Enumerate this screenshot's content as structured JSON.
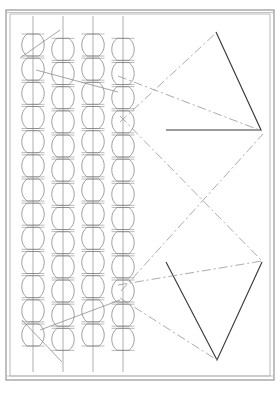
{
  "drawing": {
    "title": "Technical line drawing",
    "description": "Patent-style mechanical schematic: four vertical columns of stacked rounded cells on the left, two solid outline triangles on the right, connected by dash-dot construction lines.",
    "canvas": {
      "width": 280,
      "height": 395
    },
    "colors": {
      "background": "#ffffff",
      "frame_outer": "#8a8a8a",
      "frame_inner": "#b4b4b4",
      "cell_stroke": "#808080",
      "column_line": "#9a9a9a",
      "triangle_stroke": "#3a3a3a",
      "construction_line": "#9c9c9c",
      "diagonal_line": "#8e8e8e"
    },
    "frame": {
      "outer": {
        "x": 6,
        "y": 10,
        "width": 268,
        "height": 370
      },
      "inner": {
        "x": 10,
        "y": 14,
        "width": 260,
        "height": 362
      },
      "top_rail_y": 14,
      "bottom_rail_y": 376,
      "stroke_width_outer": 1.1,
      "stroke_width_inner": 0.9
    },
    "columns": {
      "count": 4,
      "cell_count_per_column": 13,
      "cell_width": 26,
      "cell_height": 22,
      "top_cell_y": 45,
      "bottom_cell_y": 335,
      "centers_x": [
        33,
        63,
        93,
        123
      ],
      "stem_top_y": 16,
      "stem_bottom_y": 372,
      "labels": [
        "column-1",
        "column-2",
        "column-3",
        "column-4"
      ]
    },
    "triangles": [
      {
        "name": "upper-triangle",
        "points": "216,32 261,130 166,130",
        "closed": false,
        "vertices": [
          [
            216,
            32
          ],
          [
            261,
            130
          ]
        ]
      },
      {
        "name": "lower-triangle",
        "points": "262,262 217,360 166,262",
        "closed": false,
        "vertices": [
          [
            262,
            262
          ],
          [
            217,
            360
          ]
        ]
      }
    ],
    "construction_lines": [
      {
        "name": "line-a",
        "x1": 118,
        "y1": 76,
        "x2": 262,
        "y2": 131
      },
      {
        "name": "line-b",
        "x1": 120,
        "y1": 116,
        "x2": 263,
        "y2": 262
      },
      {
        "name": "line-c",
        "x1": 120,
        "y1": 122,
        "x2": 216,
        "y2": 33
      },
      {
        "name": "line-d",
        "x1": 118,
        "y1": 285,
        "x2": 262,
        "y2": 261
      },
      {
        "name": "line-e",
        "x1": 120,
        "y1": 298,
        "x2": 217,
        "y2": 360
      },
      {
        "name": "line-f",
        "x1": 121,
        "y1": 291,
        "x2": 263,
        "y2": 134
      }
    ],
    "diagonal_marks": [
      {
        "name": "diagonal-top",
        "x1": 20,
        "y1": 58,
        "x2": 60,
        "y2": 30
      },
      {
        "name": "diagonal-top-2",
        "x1": 36,
        "y1": 70,
        "x2": 118,
        "y2": 92
      },
      {
        "name": "diagonal-bottom",
        "x1": 22,
        "y1": 320,
        "x2": 62,
        "y2": 362
      },
      {
        "name": "diagonal-bottom-2",
        "x1": 40,
        "y1": 330,
        "x2": 120,
        "y2": 300
      }
    ]
  }
}
